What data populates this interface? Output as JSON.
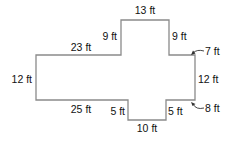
{
  "figure": {
    "type": "composite-rectilinear-shape",
    "outline_color": "#8a8a8a",
    "text_color": "#111111",
    "unit": "ft",
    "labels": {
      "top": "13 ft",
      "upper_left_vertical": "9 ft",
      "upper_right_vertical": "9 ft",
      "top_right_step": "7 ft",
      "left_top": "23 ft",
      "left_side": "12 ft",
      "right_side": "12 ft",
      "left_bottom": "25 ft",
      "notch_left_vertical": "5 ft",
      "notch_right_vertical": "5 ft",
      "bottom_right_step": "8 ft",
      "bottom": "10 ft"
    }
  }
}
